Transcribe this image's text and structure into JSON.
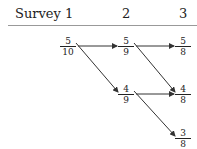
{
  "header": {
    "label": "Survey",
    "columns": [
      "1",
      "2",
      "3"
    ]
  },
  "nodes": [
    {
      "id": "s1_a",
      "num": "5",
      "den": "10"
    },
    {
      "id": "s2_a",
      "num": "5",
      "den": "9"
    },
    {
      "id": "s3_a",
      "num": "5",
      "den": "8"
    },
    {
      "id": "s2_b",
      "num": "4",
      "den": "9"
    },
    {
      "id": "s3_b",
      "num": "4",
      "den": "8"
    },
    {
      "id": "s3_c",
      "num": "3",
      "den": "8"
    }
  ],
  "edges": [
    {
      "from": "s1_a",
      "to": "s2_a"
    },
    {
      "from": "s1_a",
      "to": "s2_b"
    },
    {
      "from": "s2_a",
      "to": "s3_a"
    },
    {
      "from": "s2_a",
      "to": "s3_b"
    },
    {
      "from": "s2_b",
      "to": "s3_b"
    },
    {
      "from": "s2_b",
      "to": "s3_c"
    }
  ]
}
